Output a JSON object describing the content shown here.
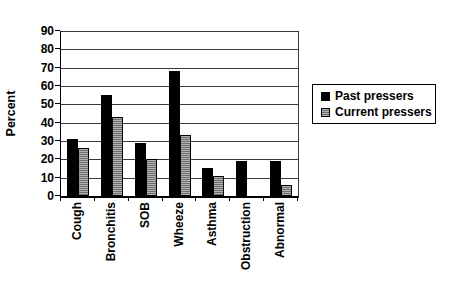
{
  "figure": {
    "background": "#ffffff",
    "bar_color_past": "#000000",
    "bar_color_current": "#8c8c8c",
    "axis_color": "#000000"
  },
  "legend": {
    "items": [
      {
        "label": "Past pressers",
        "marker": "black-solid-square"
      },
      {
        "label": "Current pressers",
        "marker": "gray-hatched-square"
      }
    ]
  },
  "chart_data": {
    "type": "bar",
    "title": "",
    "xlabel": "",
    "ylabel": "Percent",
    "categories": [
      "Cough",
      "Bronchitis",
      "SOB",
      "Wheeze",
      "Asthma",
      "Obstruction",
      "Abnormal"
    ],
    "series": [
      {
        "name": "Past pressers",
        "color": "#000000",
        "pattern": "solid",
        "values": [
          31,
          55,
          29,
          68,
          15,
          19,
          19
        ]
      },
      {
        "name": "Current pressers",
        "color": "#8c8c8c",
        "pattern": "horizontal-hatch",
        "values": [
          26,
          43,
          20,
          33,
          11,
          0,
          6
        ]
      }
    ],
    "ylim": [
      0,
      90
    ],
    "yticks": [
      0,
      10,
      20,
      30,
      40,
      50,
      60,
      70,
      80,
      90
    ],
    "grid": "horizontal",
    "legend_position": "right",
    "category_labels_rotation": -90
  }
}
